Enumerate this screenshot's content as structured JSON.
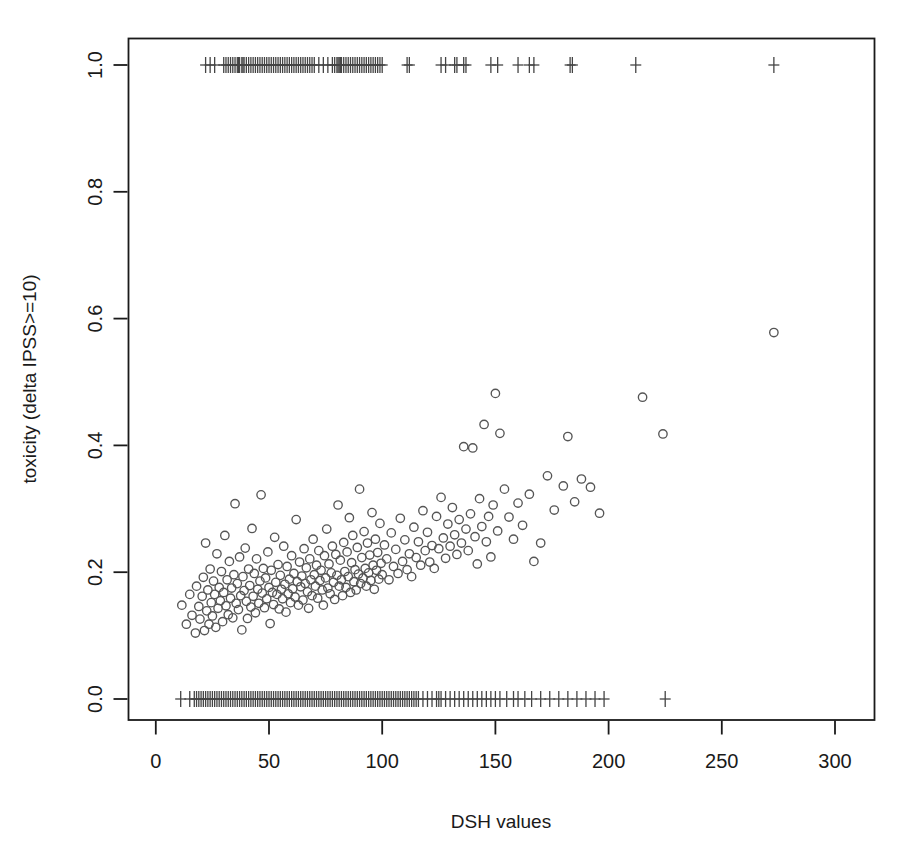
{
  "chart_data": {
    "type": "scatter",
    "title": "",
    "xlabel": "DSH values",
    "ylabel": "toxicity (delta IPSS>=10)",
    "xlim": [
      -8,
      313
    ],
    "ylim": [
      -0.048,
      1.048
    ],
    "grid": false,
    "legend": "none",
    "xticks": [
      0,
      50,
      100,
      150,
      200,
      250,
      300
    ],
    "xtick_labels": [
      "0",
      "50",
      "100",
      "150",
      "200",
      "250",
      "300"
    ],
    "yticks": [
      0.0,
      0.2,
      0.4,
      0.6,
      0.8,
      1.0
    ],
    "ytick_labels": [
      "0.0",
      "0.2",
      "0.4",
      "0.6",
      "0.8",
      "1.0"
    ],
    "marker": "open-circle",
    "marker_color": "#555555",
    "rug_marker": "plus",
    "rug_color": "#444444",
    "box_color": "#1a1a1a",
    "background": "#ffffff",
    "series": [
      {
        "name": "predicted toxicity",
        "marker": "open-circle",
        "points": [
          [
            11.5,
            0.148
          ],
          [
            13.5,
            0.118
          ],
          [
            15.0,
            0.165
          ],
          [
            16.0,
            0.132
          ],
          [
            17.5,
            0.104
          ],
          [
            18.0,
            0.178
          ],
          [
            19.0,
            0.146
          ],
          [
            19.5,
            0.126
          ],
          [
            20.5,
            0.162
          ],
          [
            21.0,
            0.192
          ],
          [
            21.5,
            0.108
          ],
          [
            22.0,
            0.246
          ],
          [
            22.5,
            0.139
          ],
          [
            23.0,
            0.172
          ],
          [
            23.5,
            0.118
          ],
          [
            24.0,
            0.205
          ],
          [
            24.5,
            0.152
          ],
          [
            25.0,
            0.131
          ],
          [
            25.5,
            0.186
          ],
          [
            26.0,
            0.165
          ],
          [
            26.5,
            0.113
          ],
          [
            27.0,
            0.229
          ],
          [
            27.5,
            0.143
          ],
          [
            28.0,
            0.176
          ],
          [
            28.5,
            0.155
          ],
          [
            29.0,
            0.201
          ],
          [
            29.5,
            0.122
          ],
          [
            30.0,
            0.168
          ],
          [
            30.5,
            0.258
          ],
          [
            31.0,
            0.147
          ],
          [
            31.5,
            0.188
          ],
          [
            32.0,
            0.133
          ],
          [
            32.5,
            0.217
          ],
          [
            33.0,
            0.159
          ],
          [
            33.5,
            0.175
          ],
          [
            34.0,
            0.128
          ],
          [
            34.5,
            0.196
          ],
          [
            35.0,
            0.308
          ],
          [
            35.5,
            0.151
          ],
          [
            36.0,
            0.182
          ],
          [
            36.5,
            0.141
          ],
          [
            37.0,
            0.224
          ],
          [
            37.5,
            0.163
          ],
          [
            38.0,
            0.109
          ],
          [
            38.5,
            0.193
          ],
          [
            39.0,
            0.171
          ],
          [
            39.5,
            0.238
          ],
          [
            40.0,
            0.154
          ],
          [
            40.5,
            0.127
          ],
          [
            41.0,
            0.205
          ],
          [
            41.5,
            0.179
          ],
          [
            42.0,
            0.145
          ],
          [
            42.5,
            0.269
          ],
          [
            43.0,
            0.162
          ],
          [
            43.5,
            0.198
          ],
          [
            44.0,
            0.136
          ],
          [
            44.5,
            0.221
          ],
          [
            45.0,
            0.173
          ],
          [
            45.5,
            0.151
          ],
          [
            46.0,
            0.186
          ],
          [
            46.5,
            0.322
          ],
          [
            47.0,
            0.167
          ],
          [
            47.5,
            0.206
          ],
          [
            48.0,
            0.144
          ],
          [
            48.5,
            0.191
          ],
          [
            49.0,
            0.158
          ],
          [
            49.5,
            0.232
          ],
          [
            50.0,
            0.176
          ],
          [
            50.5,
            0.119
          ],
          [
            51.0,
            0.203
          ],
          [
            51.5,
            0.168
          ],
          [
            52.0,
            0.149
          ],
          [
            52.5,
            0.255
          ],
          [
            53.0,
            0.184
          ],
          [
            53.5,
            0.165
          ],
          [
            54.0,
            0.212
          ],
          [
            54.5,
            0.142
          ],
          [
            55.0,
            0.195
          ],
          [
            55.5,
            0.173
          ],
          [
            56.0,
            0.158
          ],
          [
            56.5,
            0.241
          ],
          [
            57.0,
            0.181
          ],
          [
            57.5,
            0.137
          ],
          [
            58.0,
            0.209
          ],
          [
            58.5,
            0.166
          ],
          [
            59.0,
            0.189
          ],
          [
            59.5,
            0.152
          ],
          [
            60.0,
            0.226
          ],
          [
            60.5,
            0.174
          ],
          [
            61.0,
            0.198
          ],
          [
            61.5,
            0.161
          ],
          [
            62.0,
            0.283
          ],
          [
            62.5,
            0.185
          ],
          [
            63.0,
            0.148
          ],
          [
            63.5,
            0.216
          ],
          [
            64.0,
            0.177
          ],
          [
            64.5,
            0.194
          ],
          [
            65.0,
            0.156
          ],
          [
            65.5,
            0.237
          ],
          [
            66.0,
            0.182
          ],
          [
            66.5,
            0.207
          ],
          [
            67.0,
            0.169
          ],
          [
            67.5,
            0.143
          ],
          [
            68.0,
            0.221
          ],
          [
            68.5,
            0.188
          ],
          [
            69.0,
            0.163
          ],
          [
            69.5,
            0.252
          ],
          [
            70.0,
            0.196
          ],
          [
            70.5,
            0.178
          ],
          [
            71.0,
            0.211
          ],
          [
            71.5,
            0.159
          ],
          [
            72.0,
            0.234
          ],
          [
            72.5,
            0.187
          ],
          [
            73.0,
            0.203
          ],
          [
            73.5,
            0.172
          ],
          [
            74.0,
            0.148
          ],
          [
            74.5,
            0.226
          ],
          [
            75.0,
            0.191
          ],
          [
            75.5,
            0.268
          ],
          [
            76.0,
            0.175
          ],
          [
            76.5,
            0.213
          ],
          [
            77.0,
            0.166
          ],
          [
            77.5,
            0.199
          ],
          [
            78.0,
            0.241
          ],
          [
            78.5,
            0.184
          ],
          [
            79.0,
            0.157
          ],
          [
            79.5,
            0.228
          ],
          [
            80.0,
            0.195
          ],
          [
            80.5,
            0.306
          ],
          [
            81.0,
            0.178
          ],
          [
            81.5,
            0.219
          ],
          [
            82.0,
            0.188
          ],
          [
            82.5,
            0.163
          ],
          [
            83.0,
            0.247
          ],
          [
            83.5,
            0.201
          ],
          [
            84.0,
            0.176
          ],
          [
            84.5,
            0.232
          ],
          [
            85.0,
            0.193
          ],
          [
            85.5,
            0.286
          ],
          [
            86.0,
            0.168
          ],
          [
            86.5,
            0.215
          ],
          [
            87.0,
            0.258
          ],
          [
            87.5,
            0.185
          ],
          [
            88.0,
            0.204
          ],
          [
            88.5,
            0.172
          ],
          [
            89.0,
            0.239
          ],
          [
            89.5,
            0.197
          ],
          [
            90.0,
            0.331
          ],
          [
            90.5,
            0.182
          ],
          [
            91.0,
            0.223
          ],
          [
            91.5,
            0.191
          ],
          [
            92.0,
            0.264
          ],
          [
            92.5,
            0.206
          ],
          [
            93.0,
            0.178
          ],
          [
            93.5,
            0.246
          ],
          [
            94.0,
            0.199
          ],
          [
            94.5,
            0.227
          ],
          [
            95.0,
            0.187
          ],
          [
            95.5,
            0.294
          ],
          [
            96.0,
            0.211
          ],
          [
            96.5,
            0.173
          ],
          [
            97.0,
            0.252
          ],
          [
            97.5,
            0.203
          ],
          [
            98.0,
            0.231
          ],
          [
            98.5,
            0.189
          ],
          [
            99.0,
            0.277
          ],
          [
            99.5,
            0.214
          ],
          [
            100.0,
            0.196
          ],
          [
            101.0,
            0.243
          ],
          [
            102.0,
            0.221
          ],
          [
            103.0,
            0.188
          ],
          [
            104.0,
            0.262
          ],
          [
            105.0,
            0.209
          ],
          [
            106.0,
            0.236
          ],
          [
            107.0,
            0.198
          ],
          [
            108.0,
            0.285
          ],
          [
            109.0,
            0.217
          ],
          [
            110.0,
            0.251
          ],
          [
            111.0,
            0.204
          ],
          [
            112.0,
            0.229
          ],
          [
            113.0,
            0.193
          ],
          [
            114.0,
            0.271
          ],
          [
            115.0,
            0.223
          ],
          [
            116.0,
            0.248
          ],
          [
            117.0,
            0.211
          ],
          [
            118.0,
            0.297
          ],
          [
            119.0,
            0.234
          ],
          [
            120.0,
            0.263
          ],
          [
            121.0,
            0.216
          ],
          [
            122.0,
            0.242
          ],
          [
            123.0,
            0.206
          ],
          [
            124.0,
            0.288
          ],
          [
            125.0,
            0.237
          ],
          [
            126.0,
            0.318
          ],
          [
            127.0,
            0.254
          ],
          [
            128.0,
            0.222
          ],
          [
            129.0,
            0.276
          ],
          [
            130.0,
            0.241
          ],
          [
            131.0,
            0.302
          ],
          [
            132.0,
            0.259
          ],
          [
            133.0,
            0.228
          ],
          [
            134.0,
            0.283
          ],
          [
            135.0,
            0.246
          ],
          [
            136.0,
            0.398
          ],
          [
            137.0,
            0.268
          ],
          [
            138.0,
            0.234
          ],
          [
            139.0,
            0.292
          ],
          [
            140.0,
            0.396
          ],
          [
            141.0,
            0.256
          ],
          [
            142.0,
            0.213
          ],
          [
            143.0,
            0.316
          ],
          [
            144.0,
            0.272
          ],
          [
            145.0,
            0.433
          ],
          [
            146.0,
            0.248
          ],
          [
            147.0,
            0.288
          ],
          [
            148.0,
            0.224
          ],
          [
            149.0,
            0.306
          ],
          [
            150.0,
            0.482
          ],
          [
            151.0,
            0.265
          ],
          [
            152.0,
            0.419
          ],
          [
            154.0,
            0.331
          ],
          [
            156.0,
            0.287
          ],
          [
            158.0,
            0.252
          ],
          [
            160.0,
            0.309
          ],
          [
            162.0,
            0.274
          ],
          [
            165.0,
            0.323
          ],
          [
            167.0,
            0.217
          ],
          [
            170.0,
            0.246
          ],
          [
            173.0,
            0.352
          ],
          [
            176.0,
            0.298
          ],
          [
            180.0,
            0.336
          ],
          [
            182.0,
            0.414
          ],
          [
            185.0,
            0.311
          ],
          [
            188.0,
            0.347
          ],
          [
            192.0,
            0.334
          ],
          [
            196.0,
            0.293
          ],
          [
            215.0,
            0.476
          ],
          [
            224.0,
            0.418
          ],
          [
            273.0,
            0.578
          ]
        ]
      }
    ],
    "rug_top": {
      "y": 1.0,
      "label": "toxicity events (outcome = 1)",
      "values": [
        22,
        24,
        26,
        30,
        31,
        32,
        33,
        34,
        35,
        36,
        36.5,
        37,
        38,
        38.5,
        39,
        40,
        41,
        42,
        43,
        44,
        45,
        46,
        47,
        48,
        49,
        50,
        51,
        52,
        53,
        54,
        55,
        56,
        57,
        58,
        59,
        60,
        61,
        62,
        63,
        64,
        65,
        66,
        67,
        68,
        69,
        70,
        72,
        74,
        76,
        78,
        79,
        80,
        80.5,
        81,
        81.5,
        82,
        83,
        84,
        85,
        86,
        87,
        88,
        89,
        90,
        91,
        92,
        93,
        94,
        95,
        96,
        97,
        98,
        99,
        100,
        111,
        112,
        126,
        128,
        132,
        133,
        136,
        137,
        148,
        151,
        160,
        165,
        167,
        183,
        184,
        212,
        273
      ]
    },
    "rug_bottom": {
      "y": 0.0,
      "label": "non-events (outcome = 0)",
      "values": [
        11,
        15,
        17,
        18,
        19,
        20,
        21,
        22,
        23,
        24,
        25,
        26,
        27,
        28,
        29,
        30,
        31,
        32,
        33,
        34,
        35,
        36,
        37,
        38,
        39,
        40,
        41,
        42,
        43,
        44,
        45,
        46,
        47,
        48,
        49,
        50,
        51,
        52,
        53,
        54,
        55,
        56,
        57,
        58,
        59,
        60,
        61,
        62,
        63,
        64,
        65,
        66,
        67,
        68,
        69,
        70,
        71,
        72,
        73,
        74,
        75,
        76,
        77,
        78,
        79,
        80,
        81,
        82,
        83,
        84,
        85,
        86,
        87,
        88,
        89,
        90,
        91,
        92,
        93,
        94,
        95,
        96,
        97,
        98,
        99,
        100,
        101,
        102,
        103,
        104,
        105,
        106,
        107,
        108,
        109,
        110,
        111,
        112,
        113,
        114,
        115,
        116,
        118,
        120,
        122,
        124,
        125,
        126,
        128,
        130,
        132,
        134,
        136,
        138,
        140,
        142,
        144,
        146,
        148,
        150,
        152,
        155,
        158,
        160,
        163,
        166,
        170,
        174,
        178,
        182,
        186,
        190,
        194,
        198,
        225
      ]
    }
  }
}
